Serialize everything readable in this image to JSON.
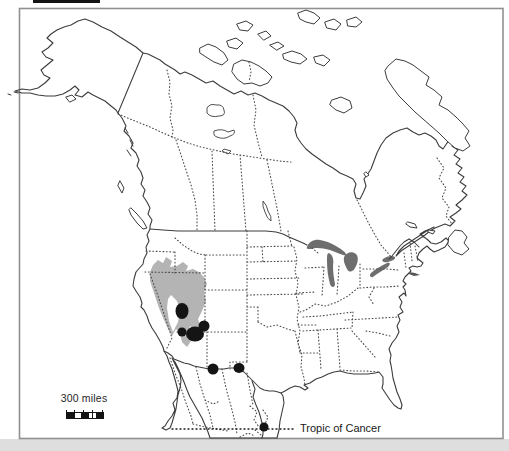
{
  "figure": {
    "kind": "distribution-map",
    "area_shown": "North America"
  },
  "labels": {
    "scale_bar": "300 miles",
    "tropic_of_cancer": "Tropic of Cancer"
  },
  "colors": {
    "background": "#ffffff",
    "coastline": "#3c3c3c",
    "dotted_borders": "#4a4a4a",
    "great_lakes": "#6e6e6e",
    "shaded_range": "#b4b4b4",
    "occurrence_dots": "#141414",
    "frame": "#909090",
    "below_frame_strip": "#dedede"
  },
  "map": {
    "markers": [
      {
        "x": 182,
        "y": 311,
        "rx": 6.5,
        "ry": 8
      },
      {
        "x": 182,
        "y": 332,
        "rx": 4.5,
        "ry": 4.5
      },
      {
        "x": 195,
        "y": 334,
        "rx": 9,
        "ry": 7.5
      },
      {
        "x": 204,
        "y": 326,
        "rx": 5.5,
        "ry": 5.5
      },
      {
        "x": 213,
        "y": 369,
        "rx": 5.5,
        "ry": 5.5
      },
      {
        "x": 239,
        "y": 368,
        "rx": 5.5,
        "ry": 5
      },
      {
        "x": 264,
        "y": 427,
        "rx": 4.5,
        "ry": 4.5
      }
    ],
    "tropic_line": {
      "y": 429,
      "x1": 172,
      "x2": 296
    }
  }
}
